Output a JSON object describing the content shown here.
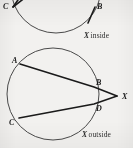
{
  "figure": {
    "background_color": "#f2f1ef",
    "ink_color": "#1a1a1a",
    "curve_color": "#4a4a4a"
  },
  "top_figure": {
    "name": "x-inside",
    "caption_variable": "X",
    "caption_text": "inside",
    "circle": {
      "cx": 56,
      "cy": -12,
      "r": 45,
      "clipped_top": true
    },
    "points": [
      {
        "label": "C",
        "x": 11,
        "y": 5,
        "label_x": 3,
        "label_y": 7
      },
      {
        "label": "B",
        "x": 95,
        "y": 6,
        "label_x": 97,
        "label_y": 8
      }
    ],
    "chords": [
      {
        "from": "C",
        "to": "upper-right",
        "x1": 13,
        "y1": 7,
        "x2": 30,
        "y2": -6
      },
      {
        "from": "C",
        "to": "upper-right-2",
        "x1": 13,
        "y1": 7,
        "x2": 26,
        "y2": -9
      },
      {
        "from": "B",
        "to": "lower-left",
        "x1": 95,
        "y1": 7,
        "x2": 88,
        "y2": 22
      }
    ]
  },
  "bottom_figure": {
    "name": "x-outside",
    "caption_variable": "X",
    "caption_text": "outside",
    "circle": {
      "cx": 53,
      "cy": 94,
      "r": 46
    },
    "points": [
      {
        "label": "A",
        "x": 20,
        "y": 64,
        "label_x": 12,
        "label_y": 63
      },
      {
        "label": "B",
        "x": 94,
        "y": 87,
        "label_x": 96,
        "label_y": 86
      },
      {
        "label": "D",
        "x": 94,
        "y": 104,
        "label_x": 96,
        "label_y": 110
      },
      {
        "label": "C",
        "x": 19,
        "y": 118,
        "label_x": 10,
        "label_y": 124
      },
      {
        "label": "X",
        "x": 117,
        "y": 96,
        "label_x": 121,
        "label_y": 98
      }
    ],
    "secants": [
      {
        "name": "secant-A-B-X",
        "from": "A",
        "through": "B",
        "to": "X"
      },
      {
        "name": "secant-C-D-X",
        "from": "C",
        "through": "D",
        "to": "X"
      }
    ]
  }
}
